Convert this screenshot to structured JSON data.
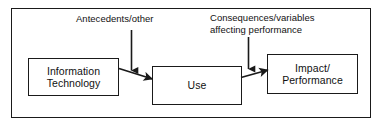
{
  "diagram": {
    "frame": {
      "name": "outer-border"
    },
    "nodes": [
      {
        "id": "information-technology",
        "lines": [
          "Information",
          "Technology"
        ]
      },
      {
        "id": "use",
        "lines": [
          "Use"
        ]
      },
      {
        "id": "impact-performance",
        "lines": [
          "Impact/",
          "Performance"
        ]
      }
    ],
    "annotations": [
      {
        "id": "antecedents",
        "lines": [
          "Antecedents/other"
        ]
      },
      {
        "id": "consequences",
        "lines": [
          "Consequences/variables",
          "affecting performance"
        ]
      }
    ],
    "arrows": [
      {
        "id": "antecedents-to-flow",
        "type": "vertical-down"
      },
      {
        "id": "consequences-to-flow",
        "type": "vertical-down"
      },
      {
        "id": "it-to-use",
        "type": "diagonal-right"
      },
      {
        "id": "use-to-impact",
        "type": "diagonal-right"
      }
    ],
    "colors": {
      "stroke": "#1a1a1a",
      "text": "#111111",
      "background": "#ffffff"
    }
  }
}
